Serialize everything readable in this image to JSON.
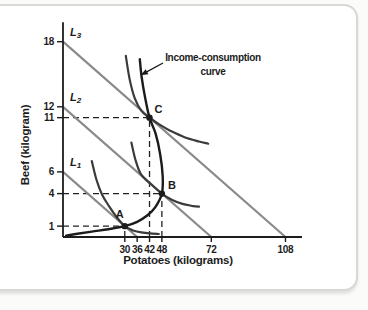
{
  "chart_data": {
    "type": "line",
    "title": "",
    "xlabel": "Potatoes (kilograms)",
    "ylabel": "Beef (kilogram)",
    "x_ticks": [
      30,
      36,
      42,
      48,
      72,
      108
    ],
    "y_ticks": [
      1,
      4,
      6,
      11,
      12,
      18
    ],
    "xlim": [
      0,
      116
    ],
    "ylim": [
      0,
      19.8
    ],
    "grid": "off",
    "budget_lines": [
      {
        "base": "L",
        "sub": "1",
        "x_intercept": 36,
        "y_intercept": 6,
        "label_at": {
          "x": 3.4,
          "y": 6.55
        }
      },
      {
        "base": "L",
        "sub": "2",
        "x_intercept": 72,
        "y_intercept": 12,
        "label_at": {
          "x": 3.4,
          "y": 12.55
        }
      },
      {
        "base": "L",
        "sub": "3",
        "x_intercept": 108,
        "y_intercept": 18,
        "label_at": {
          "x": 3.4,
          "y": 18.55
        }
      }
    ],
    "points": [
      {
        "name": "A",
        "x": 30,
        "y": 1
      },
      {
        "name": "B",
        "x": 48,
        "y": 4
      },
      {
        "name": "C",
        "x": 42,
        "y": 11
      }
    ],
    "income_consumption_curve": {
      "points": [
        [
          1.5,
          0.12
        ],
        [
          7,
          0.3
        ],
        [
          14,
          0.5
        ],
        [
          22,
          0.72
        ],
        [
          30,
          1
        ],
        [
          36,
          1.4
        ],
        [
          41,
          2.0
        ],
        [
          45,
          2.8
        ],
        [
          48,
          4
        ],
        [
          48.4,
          5.6
        ],
        [
          47.2,
          7.6
        ],
        [
          45,
          9.5
        ],
        [
          42,
          11
        ],
        [
          39.8,
          12.9
        ],
        [
          38.2,
          14.7
        ],
        [
          37.3,
          16.4
        ]
      ]
    },
    "indifference_curves": [
      {
        "tangent_at": "A",
        "points": [
          [
            14,
            7
          ],
          [
            16.2,
            5.3
          ],
          [
            19,
            3.9
          ],
          [
            22.5,
            2.8
          ],
          [
            26.2,
            1.8
          ],
          [
            30,
            1
          ],
          [
            34,
            0.6
          ],
          [
            38,
            0.42
          ],
          [
            42,
            0.33
          ],
          [
            46.5,
            0.28
          ]
        ]
      },
      {
        "tangent_at": "B",
        "points": [
          [
            33.2,
            8.7
          ],
          [
            35.2,
            7.1
          ],
          [
            37.8,
            5.8
          ],
          [
            42.5,
            4.9
          ],
          [
            48,
            4
          ],
          [
            53,
            3.4
          ],
          [
            58,
            3.05
          ],
          [
            62.5,
            2.88
          ],
          [
            66,
            2.8
          ]
        ]
      },
      {
        "tangent_at": "C",
        "points": [
          [
            30.5,
            16.7
          ],
          [
            32.3,
            14.6
          ],
          [
            34.8,
            12.8
          ],
          [
            38.2,
            11.6
          ],
          [
            42,
            11
          ],
          [
            46.5,
            10.4
          ],
          [
            52,
            9.8
          ],
          [
            59,
            9.2
          ],
          [
            66,
            8.8
          ],
          [
            70.5,
            8.6
          ]
        ]
      }
    ],
    "annotation": {
      "line1": "Income-consumption",
      "line2": "curve",
      "target": {
        "x": 37.6,
        "y": 14.9
      }
    },
    "colors": {
      "budget_line": "#8a8a8a",
      "indifference_curve": "#3b3b3b",
      "income_consumption_curve": "#1c1c1c",
      "axis": "#1c1c1c",
      "dashed_guide": "#222222",
      "text": "#1c1c1c",
      "card_border": "#d8d8d8",
      "card_background": "#ffffff",
      "page_background": "#fbfbfa"
    }
  }
}
